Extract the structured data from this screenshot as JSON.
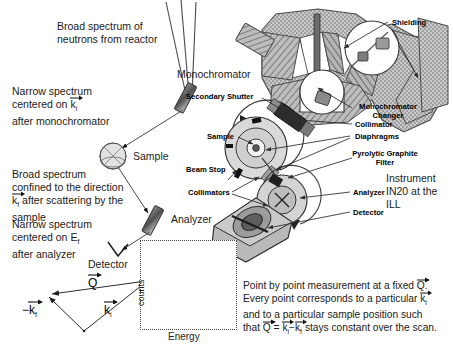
{
  "figure": {
    "title_region": "Triple-axis neutron spectrometer schematic",
    "left_annotations": {
      "beam_source": "Broad spectrum of\nneutrons from reactor",
      "after_mono_l1": "Narrow spectrum",
      "after_mono_l2": "centered on k",
      "after_mono_l2_sub": "i",
      "after_mono_l3": "after monochromator",
      "after_sample_l1": "Broad spectrum",
      "after_sample_l2": "confined to the direction",
      "after_sample_l3_pre": "k",
      "after_sample_l3_sub": "f",
      "after_sample_l3_post": " after scattering by the",
      "after_sample_l4": "sample",
      "after_analyzer_l1": "Narrow spectrum",
      "after_analyzer_l2_pre": "centered on E",
      "after_analyzer_l2_sub": "f",
      "after_analyzer_l3": "after analyzer"
    },
    "schematic_labels": {
      "monochromator": "Monochromator",
      "sample": "Sample",
      "analyzer": "Analyzer",
      "detector": "Detector"
    },
    "instrument_labels": {
      "shielding": "Shielding",
      "secondary_shutter": "Secondary Shutter",
      "sample": "Sample",
      "beam_stop": "Beam Stop",
      "collimators": "Collimators",
      "collimator": "Collimator",
      "diaphragms": "Diaphragms",
      "pyrolytic_graphite_filter_l1": "Pyrolytic Graphite",
      "pyrolytic_graphite_filter_l2": "Filter",
      "monochromator_changer_l1": "Monochromator",
      "monochromator_changer_l2": "Changer",
      "analyzer": "Analyzer",
      "detector": "Detector",
      "instrument_name_l1": "Instrument",
      "instrument_name_l2": "IN20 at the ILL"
    },
    "vector_triangle": {
      "q_label": "Q",
      "kf_label_pre": "−k",
      "kf_label_sub": "f",
      "ki_label": "k",
      "ki_label_sub": "i"
    },
    "caption": {
      "line1_pre": "Point by point measurement at a fixed ",
      "line1_vec": "Q",
      "line1_post": ".",
      "line2_pre": "Every point corresponds to a particular ",
      "line2_vec": "k",
      "line2_vec_sub": "i",
      "line3": "and to a particular sample position such",
      "line4_pre": "that ",
      "line4_q": "Q",
      "line4_eq": " = ",
      "line4_ki": "k",
      "line4_ki_sub": "i",
      "line4_minus": " − ",
      "line4_kf": "k",
      "line4_kf_sub": "f",
      "line4_post": " stays constant over the scan."
    },
    "colors": {
      "ink": "#1a1a1a",
      "line": "#555555",
      "shield_fill": "#b8b8b8",
      "body_gray": "#9a9a9a",
      "dark_gray": "#4d4d4d",
      "light_gray": "#d0d0d0",
      "mid_gray": "#7a7a7a"
    }
  },
  "chart_data": {
    "type": "line",
    "title": "",
    "xlabel": "Energy",
    "ylabel": "counts",
    "grid": false,
    "legend": "none",
    "xlim": [
      0,
      100
    ],
    "ylim": [
      0,
      100
    ],
    "annotation": "Gaussian-like peak centered slightly left of the plot centre",
    "x": [
      0,
      5,
      10,
      15,
      20,
      25,
      30,
      35,
      40,
      45,
      50,
      55,
      60,
      65,
      70,
      75,
      80,
      85,
      90,
      95,
      100
    ],
    "y": [
      2,
      2.5,
      3.5,
      5.5,
      9,
      16,
      28,
      45,
      66,
      85,
      96,
      93,
      78,
      57,
      37,
      22,
      12,
      7,
      4,
      2.5,
      2
    ]
  }
}
